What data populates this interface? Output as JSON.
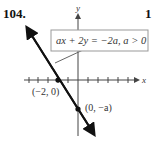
{
  "problem": {
    "number": "104.",
    "next_number_partial": "10"
  },
  "axes": {
    "x_label": "x",
    "y_label": "y"
  },
  "equation_box": {
    "text": "ax + 2y = −2a, a > 0"
  },
  "points": [
    {
      "label": "(−2, 0)"
    },
    {
      "label": "(0, −a)"
    }
  ],
  "colors": {
    "line": "#111111",
    "axis": "#444444",
    "box_border": "#999999"
  }
}
